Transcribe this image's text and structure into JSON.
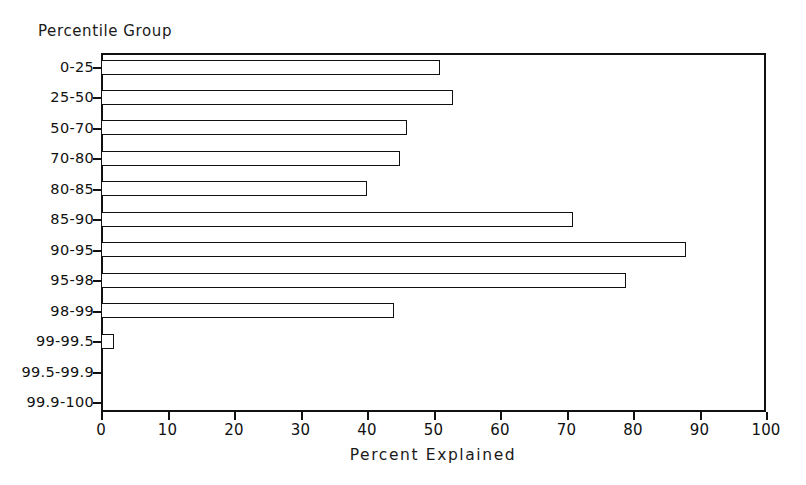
{
  "chart_data": {
    "type": "bar",
    "orientation": "horizontal",
    "title": "",
    "subtitle": "",
    "xlabel": "Percent Explained",
    "ylabel": "Percentile Group",
    "xlim": [
      0,
      100
    ],
    "xticks": [
      0,
      10,
      20,
      30,
      40,
      50,
      60,
      70,
      80,
      90,
      100
    ],
    "xtick_labels": [
      "0",
      "10",
      "20",
      "30",
      "40",
      "50",
      "60",
      "70",
      "80",
      "90",
      "100"
    ],
    "grid": false,
    "legend": null,
    "bar_facecolor": "#ffffff",
    "bar_edgecolor": "#111111",
    "axis_color": "#111111",
    "categories": [
      "0-25",
      "25-50",
      "50-70",
      "70-80",
      "80-85",
      "85-90",
      "90-95",
      "95-98",
      "98-99",
      "99-99.5",
      "99.5-99.9",
      "99.9-100"
    ],
    "values": [
      51,
      53,
      46,
      45,
      40,
      71,
      88,
      79,
      44,
      2,
      0,
      0
    ],
    "series": [
      {
        "name": "Percent Explained",
        "values": [
          51,
          53,
          46,
          45,
          40,
          71,
          88,
          79,
          44,
          2,
          0,
          0
        ]
      }
    ],
    "annotations": []
  },
  "axis": {
    "y_title": "Percentile Group",
    "x_title": "Percent Explained"
  }
}
